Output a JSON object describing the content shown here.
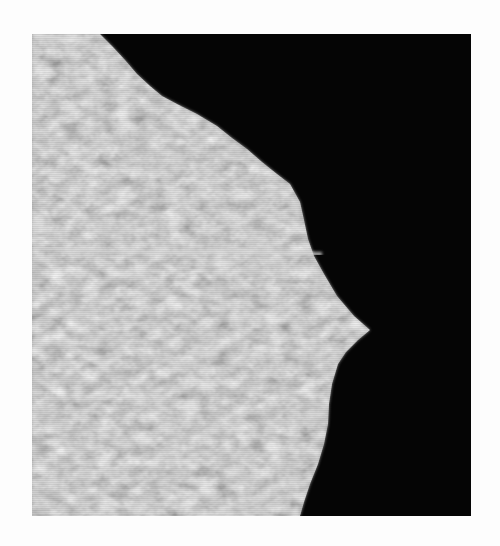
{
  "image": {
    "description": "Grayscale micrograph: textured light-gray region on left with jagged boundary against black background on right; a thin bright horizontal line crosses the gray region",
    "colors": {
      "background_page": "#fdfdfd",
      "dark_region": "#050505",
      "light_region": "#9a9a9a",
      "line": "#d8d8d8"
    }
  }
}
